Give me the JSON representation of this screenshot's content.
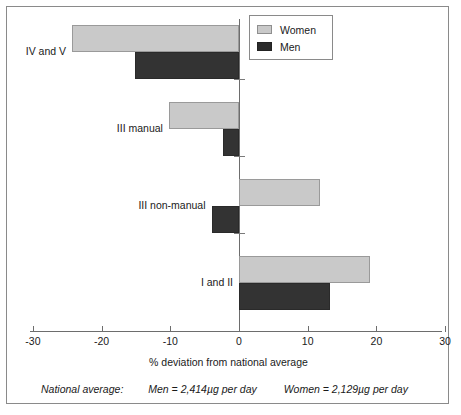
{
  "legend": {
    "items": [
      {
        "label": "Women",
        "color": "#c9c9c9"
      },
      {
        "label": "Men",
        "color": "#333333"
      }
    ]
  },
  "axis": {
    "title": "% deviation from national average",
    "ticks": [
      "-30",
      "-20",
      "-10",
      "0",
      "10",
      "20",
      "30"
    ]
  },
  "categories": [
    {
      "label": "IV and V"
    },
    {
      "label": "III manual"
    },
    {
      "label": "III non-manual"
    },
    {
      "label": "I and II"
    }
  ],
  "footnote": {
    "label": "National average:",
    "men": "Men = 2,414µg per day",
    "women": "Women = 2,129µg per day"
  },
  "chart_data": {
    "type": "bar",
    "orientation": "horizontal",
    "title": "",
    "xlabel": "% deviation from national average",
    "ylabel": "",
    "xlim": [
      -30,
      30
    ],
    "xticks": [
      -30,
      -20,
      -10,
      0,
      10,
      20,
      30
    ],
    "grid": false,
    "legend_position": "top-right",
    "categories": [
      "IV and V",
      "III manual",
      "III non-manual",
      "I and II"
    ],
    "series": [
      {
        "name": "Women",
        "color": "#c9c9c9",
        "values": [
          -24.3,
          -10.2,
          11.8,
          19.0
        ]
      },
      {
        "name": "Men",
        "color": "#333333",
        "values": [
          -15.2,
          -2.3,
          -4.0,
          13.3
        ]
      }
    ],
    "annotations": [
      "National average: Men = 2,414µg per day",
      "National average: Women = 2,129µg per day"
    ]
  }
}
